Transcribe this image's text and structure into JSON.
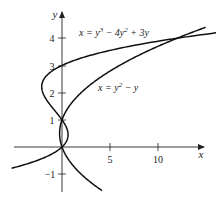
{
  "chart_data": {
    "type": "line",
    "title": "",
    "xlabel": "x",
    "ylabel": "y",
    "xlim": [
      -5,
      15
    ],
    "ylim": [
      -1.6,
      4.6
    ],
    "grid": false,
    "x_ticks": [
      5,
      10
    ],
    "y_ticks": [
      -1,
      1,
      2,
      3,
      4
    ],
    "series": [
      {
        "name": "x = y³ − 4y² + 3y",
        "equation": "x = y^3 - 4y^2 + 3y",
        "y_range": [
          -0.78,
          4.25
        ]
      },
      {
        "name": "x = y² − y",
        "equation": "x = y^2 - y",
        "y_range": [
          -1.6,
          4.4
        ]
      }
    ],
    "annotations": [
      {
        "text": "x = y³ − 4y² + 3y",
        "near": [
          3,
          4.3
        ]
      },
      {
        "text": "x = y² − y",
        "near": [
          6.5,
          2.2
        ]
      }
    ],
    "intersections": [
      [
        0,
        0
      ],
      [
        0,
        1
      ],
      [
        12,
        4
      ]
    ]
  },
  "labels": {
    "x_axis": "x",
    "y_axis": "y",
    "tick_5": "5",
    "tick_10": "10",
    "tick_neg1": "−1",
    "tick_1": "1",
    "tick_2": "2",
    "tick_3": "3",
    "tick_4": "4",
    "cubic_lhs": "x = y",
    "cubic_exp1": "3",
    "cubic_mid": " − 4y",
    "cubic_exp2": "2",
    "cubic_end": " + 3y",
    "para_lhs": "x = y",
    "para_exp": "2",
    "para_end": " − y"
  }
}
